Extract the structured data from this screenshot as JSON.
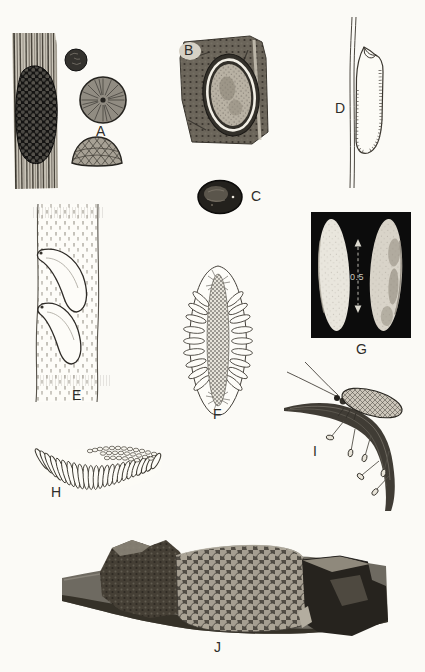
{
  "plate": {
    "colors": {
      "paper": "#fbfaf6",
      "ink": "#2e2c29",
      "photo_black": "#0c0c0c",
      "photo_gray": "#6e6a63"
    },
    "figures": {
      "a": {
        "label": "A"
      },
      "b": {
        "label": "B"
      },
      "c": {
        "label": "C"
      },
      "d": {
        "label": "D"
      },
      "e": {
        "label": "E"
      },
      "f": {
        "label": "F"
      },
      "g": {
        "label": "G",
        "scale_value": "0.5"
      },
      "h": {
        "label": "H"
      },
      "i": {
        "label": "I"
      },
      "j": {
        "label": "J"
      }
    }
  }
}
